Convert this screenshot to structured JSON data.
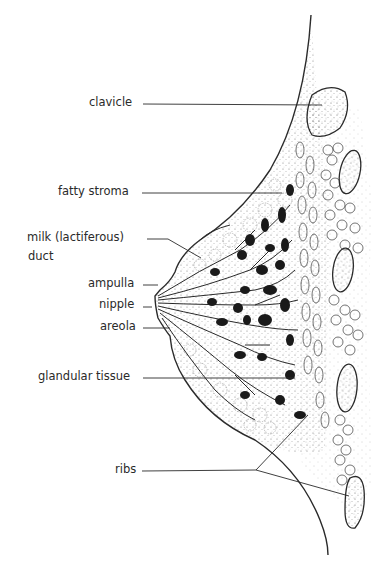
{
  "diagram": {
    "type": "anatomical cross-section",
    "labels": [
      {
        "id": "clavicle",
        "text": "clavicle"
      },
      {
        "id": "fatty-stroma",
        "text": "fatty stroma"
      },
      {
        "id": "milk-duct-line1",
        "text": "milk (lactiferous)"
      },
      {
        "id": "milk-duct-line2",
        "text": "duct"
      },
      {
        "id": "ampulla",
        "text": "ampulla"
      },
      {
        "id": "nipple",
        "text": "nipple"
      },
      {
        "id": "areola",
        "text": "areola"
      },
      {
        "id": "glandular-tissue",
        "text": "glandular tissue"
      },
      {
        "id": "ribs",
        "text": "ribs"
      }
    ],
    "colors": {
      "ink": "#2a2a2a",
      "background": "#ffffff",
      "lobule_fill": "#1a1a1a"
    }
  }
}
